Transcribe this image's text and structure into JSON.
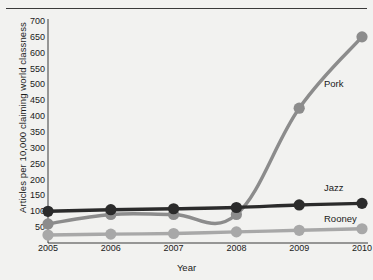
{
  "chart_data": {
    "type": "line",
    "title": "",
    "xlabel": "Year",
    "ylabel": "Articles per 10,000 claiming world classness",
    "categories": [
      "2005",
      "2006",
      "2007",
      "2008",
      "2009",
      "2010"
    ],
    "x": [
      2005,
      2006,
      2007,
      2008,
      2009,
      2010
    ],
    "xlim": [
      2005,
      2010
    ],
    "ylim": [
      0,
      700
    ],
    "yticks": [
      700,
      650,
      600,
      550,
      500,
      450,
      400,
      350,
      300,
      250,
      200,
      150,
      100,
      50
    ],
    "grid": false,
    "legend_position": "inline-right-end-labels",
    "series": [
      {
        "name": "Pork",
        "color": "#8c8c8c",
        "values": [
          60,
          90,
          90,
          90,
          425,
          650
        ],
        "label_x": 2010,
        "label_y": 500
      },
      {
        "name": "Jazz",
        "color": "#2b2b2b",
        "values": [
          100,
          105,
          108,
          112,
          120,
          125
        ],
        "label_x": 2010,
        "label_y": 175
      },
      {
        "name": "Rooney",
        "color": "#a8a8a8",
        "values": [
          25,
          28,
          30,
          35,
          40,
          45
        ],
        "label_x": 2010,
        "label_y": 75
      }
    ]
  },
  "axis": {
    "y_tick_labels": [
      "700",
      "650",
      "600",
      "550",
      "500",
      "450",
      "400",
      "350",
      "300",
      "250",
      "200",
      "150",
      "100",
      "50"
    ],
    "x_tick_labels": [
      "2005",
      "2006",
      "2007",
      "2008",
      "2009",
      "2010"
    ],
    "y_axis_title": "Articles per 10,000 claiming world classness",
    "x_axis_title": "Year"
  },
  "series_labels": {
    "pork": "Pork",
    "jazz": "Jazz",
    "rooney": "Rooney"
  },
  "colors": {
    "background": "#f2f2f0",
    "axis": "#3a3a3a",
    "pork": "#8c8c8c",
    "jazz": "#2b2b2b",
    "rooney": "#a8a8a8",
    "text": "#1a1a1a"
  }
}
